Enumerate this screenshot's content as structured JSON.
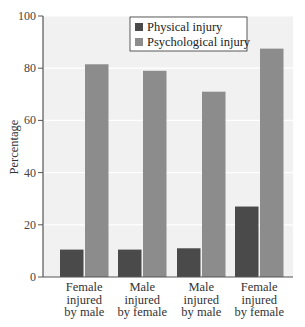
{
  "chart_data": {
    "type": "bar",
    "title": "",
    "xlabel": "",
    "ylabel": "Percentage",
    "ylim": [
      0,
      100
    ],
    "yticks": [
      0,
      20,
      40,
      60,
      80,
      100
    ],
    "grid": true,
    "legend_position": "top-center-inside",
    "categories": [
      [
        "Female",
        "injured",
        "by male"
      ],
      [
        "Male",
        "injured",
        "by female"
      ],
      [
        "Male",
        "injured",
        "by male"
      ],
      [
        "Female",
        "injured",
        "by female"
      ]
    ],
    "series": [
      {
        "name": "Physical injury",
        "color": "#4a4a4a",
        "values": [
          10.5,
          10.5,
          11,
          27
        ]
      },
      {
        "name": "Psychological injury",
        "color": "#8c8c8c",
        "values": [
          81.5,
          79,
          71,
          87.5
        ]
      }
    ]
  },
  "colors": {
    "plot_background": "#f1f1f1",
    "gridline": "#ffffff",
    "axis": "#555555"
  }
}
